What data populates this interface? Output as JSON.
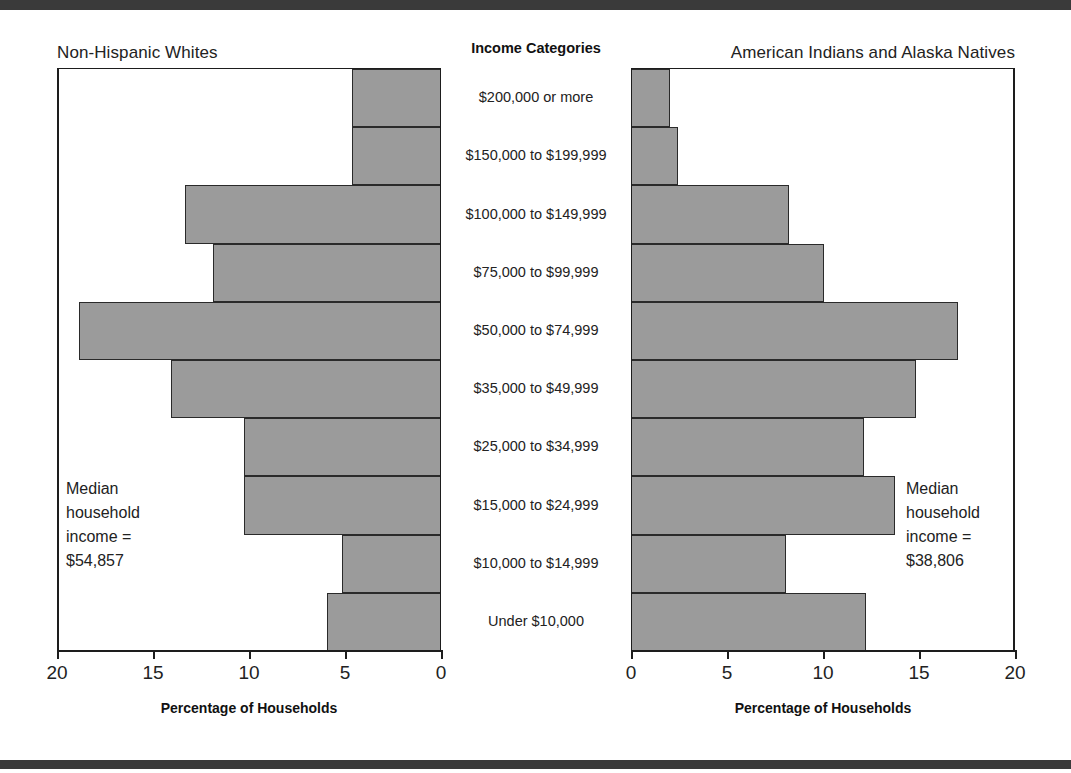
{
  "figure": {
    "center_header": "Income Categories",
    "bar_color": "#9b9b9b",
    "rule_color": "#3a3a3a"
  },
  "left_panel": {
    "title": "Non-Hispanic Whites",
    "axis_title": "Percentage of Households",
    "annotation": "Median\nhousehold\nincome =\n$54,857",
    "median_income": "$54,857"
  },
  "right_panel": {
    "title": "American Indians and Alaska Natives",
    "axis_title": "Percentage of Households",
    "annotation": "Median\nhousehold\nincome =\n$38,806",
    "median_income": "$38,806"
  },
  "axis": {
    "left_ticks": [
      "20",
      "15",
      "10",
      "5",
      "0"
    ],
    "right_ticks": [
      "0",
      "5",
      "10",
      "15",
      "20"
    ]
  },
  "chart_data": {
    "type": "bar",
    "title": "Income Categories",
    "subtitle": "Population pyramid of household income distribution",
    "orientation": "horizontal",
    "layout": "back-to-back population pyramid",
    "xlabel": "Percentage of Households",
    "ylabel": "Income Categories",
    "xlim": [
      0,
      20
    ],
    "grid": false,
    "legend": "none",
    "categories": [
      "$200,000 or more",
      "$150,000 to $199,999",
      "$100,000 to $149,999",
      "$75,000 to $99,999",
      "$50,000 to $74,999",
      "$35,000 to $49,999",
      "$25,000 to $34,999",
      "$15,000 to $24,999",
      "$10,000 to $14,999",
      "Under $10,000"
    ],
    "series": [
      {
        "name": "Non-Hispanic Whites",
        "direction": "left",
        "values": [
          4.6,
          4.6,
          13.3,
          11.8,
          18.8,
          14.0,
          10.2,
          10.2,
          5.1,
          5.9
        ]
      },
      {
        "name": "American Indians and Alaska Natives",
        "direction": "right",
        "values": [
          2.0,
          2.4,
          8.2,
          10.0,
          17.0,
          14.8,
          12.1,
          13.7,
          8.0,
          12.2
        ]
      }
    ],
    "annotations": [
      "Non-Hispanic Whites median household income = $54,857",
      "American Indians and Alaska Natives median household income = $38,806"
    ]
  }
}
